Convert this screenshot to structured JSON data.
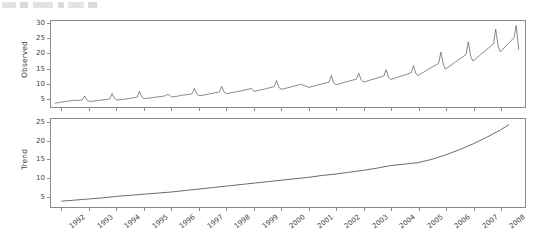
{
  "top_fragment": {
    "description": "cut-off-toolbar-strip"
  },
  "chart_data": [
    {
      "type": "line",
      "title": "",
      "panel": "Observed",
      "xlabel": "",
      "ylabel": "Observed",
      "ylim": [
        2,
        31
      ],
      "yticks": [
        5,
        10,
        15,
        20,
        25,
        30
      ],
      "xlim": [
        1991.6,
        2008.9
      ],
      "xticks": [
        1992,
        1993,
        1994,
        1995,
        1996,
        1997,
        1998,
        1999,
        2000,
        2001,
        2002,
        2003,
        2004,
        2005,
        2006,
        2007,
        2008
      ],
      "grid": false,
      "legend": null,
      "x": [
        1991.75,
        1991.83,
        1991.92,
        1992.0,
        1992.08,
        1992.17,
        1992.25,
        1992.33,
        1992.42,
        1992.5,
        1992.58,
        1992.67,
        1992.75,
        1992.83,
        1992.92,
        1993.0,
        1993.08,
        1993.17,
        1993.25,
        1993.33,
        1993.42,
        1993.5,
        1993.58,
        1993.67,
        1993.75,
        1993.83,
        1993.92,
        1994.0,
        1994.08,
        1994.17,
        1994.25,
        1994.33,
        1994.42,
        1994.5,
        1994.58,
        1994.67,
        1994.75,
        1994.83,
        1994.92,
        1995.0,
        1995.08,
        1995.17,
        1995.25,
        1995.33,
        1995.42,
        1995.5,
        1995.58,
        1995.67,
        1995.75,
        1995.83,
        1995.92,
        1996.0,
        1996.08,
        1996.17,
        1996.25,
        1996.33,
        1996.42,
        1996.5,
        1996.58,
        1996.67,
        1996.75,
        1996.83,
        1996.92,
        1997.0,
        1997.08,
        1997.17,
        1997.25,
        1997.33,
        1997.42,
        1997.5,
        1997.58,
        1997.67,
        1997.75,
        1997.83,
        1997.92,
        1998.0,
        1998.08,
        1998.17,
        1998.25,
        1998.33,
        1998.42,
        1998.5,
        1998.58,
        1998.67,
        1998.75,
        1998.83,
        1998.92,
        1999.0,
        1999.08,
        1999.17,
        1999.25,
        1999.33,
        1999.42,
        1999.5,
        1999.58,
        1999.67,
        1999.75,
        1999.83,
        1999.92,
        2000.0,
        2000.08,
        2000.17,
        2000.25,
        2000.33,
        2000.42,
        2000.5,
        2000.58,
        2000.67,
        2000.75,
        2000.83,
        2000.92,
        2001.0,
        2001.08,
        2001.17,
        2001.25,
        2001.33,
        2001.42,
        2001.5,
        2001.58,
        2001.67,
        2001.75,
        2001.83,
        2001.92,
        2002.0,
        2002.08,
        2002.17,
        2002.25,
        2002.33,
        2002.42,
        2002.5,
        2002.58,
        2002.67,
        2002.75,
        2002.83,
        2002.92,
        2003.0,
        2003.08,
        2003.17,
        2003.25,
        2003.33,
        2003.42,
        2003.5,
        2003.58,
        2003.67,
        2003.75,
        2003.83,
        2003.92,
        2004.0,
        2004.08,
        2004.17,
        2004.25,
        2004.33,
        2004.42,
        2004.5,
        2004.58,
        2004.67,
        2004.75,
        2004.83,
        2004.92,
        2005.0,
        2005.08,
        2005.17,
        2005.25,
        2005.33,
        2005.42,
        2005.5,
        2005.58,
        2005.67,
        2005.75,
        2005.83,
        2005.92,
        2006.0,
        2006.08,
        2006.17,
        2006.25,
        2006.33,
        2006.42,
        2006.5,
        2006.58,
        2006.67,
        2006.75,
        2006.83,
        2006.92,
        2007.0,
        2007.08,
        2007.17,
        2007.25,
        2007.33,
        2007.42,
        2007.5,
        2007.58,
        2007.67,
        2007.75,
        2007.83,
        2007.92,
        2008.0,
        2008.08,
        2008.17,
        2008.25,
        2008.33,
        2008.42,
        2008.5,
        2008.58,
        2008.67
      ],
      "values": [
        3.3,
        3.4,
        3.6,
        3.7,
        3.8,
        3.9,
        4.0,
        4.1,
        4.2,
        4.3,
        4.2,
        4.3,
        4.5,
        5.7,
        4.3,
        3.9,
        3.9,
        4.0,
        4.1,
        4.2,
        4.3,
        4.4,
        4.5,
        4.6,
        4.8,
        6.5,
        4.9,
        4.4,
        4.4,
        4.5,
        4.6,
        4.7,
        4.8,
        4.9,
        5.1,
        5.2,
        5.4,
        7.3,
        5.3,
        4.8,
        4.9,
        5.0,
        5.1,
        5.2,
        5.3,
        5.4,
        5.5,
        5.6,
        5.7,
        6.2,
        6.0,
        5.4,
        5.5,
        5.6,
        5.7,
        5.9,
        6.0,
        6.1,
        6.2,
        6.3,
        6.5,
        8.3,
        6.4,
        5.8,
        5.9,
        6.0,
        6.2,
        6.3,
        6.5,
        6.6,
        6.8,
        6.9,
        7.1,
        9.0,
        7.0,
        6.5,
        6.6,
        6.8,
        6.9,
        7.1,
        7.2,
        7.4,
        7.5,
        7.7,
        7.9,
        8.1,
        8.2,
        7.3,
        7.4,
        7.6,
        7.8,
        7.9,
        8.1,
        8.3,
        8.5,
        8.7,
        8.9,
        10.9,
        8.6,
        8.0,
        8.1,
        8.3,
        8.5,
        8.7,
        8.9,
        9.1,
        9.3,
        9.5,
        9.7,
        9.2,
        9.0,
        8.6,
        8.8,
        9.0,
        9.2,
        9.4,
        9.6,
        9.8,
        10.0,
        10.2,
        10.4,
        12.6,
        10.1,
        9.5,
        9.7,
        9.9,
        10.1,
        10.4,
        10.6,
        10.8,
        11.0,
        11.2,
        11.4,
        13.4,
        11.2,
        10.4,
        10.6,
        10.8,
        11.1,
        11.3,
        11.5,
        11.8,
        12.0,
        12.2,
        12.5,
        14.6,
        12.1,
        11.3,
        11.5,
        11.8,
        12.0,
        12.3,
        12.5,
        12.8,
        13.0,
        13.3,
        13.6,
        16.0,
        13.2,
        12.6,
        13.2,
        13.6,
        14.0,
        14.5,
        15.0,
        15.4,
        15.9,
        16.3,
        16.8,
        20.5,
        16.2,
        14.8,
        15.3,
        15.9,
        16.4,
        17.0,
        17.5,
        18.1,
        18.6,
        19.2,
        19.8,
        24.0,
        19.0,
        17.5,
        18.1,
        18.8,
        19.4,
        20.1,
        20.7,
        21.4,
        22.0,
        22.7,
        23.3,
        28.2,
        22.5,
        20.6,
        21.4,
        22.2,
        23.0,
        23.8,
        24.6,
        25.4,
        29.5,
        21.4
      ]
    },
    {
      "type": "line",
      "title": "",
      "panel": "Trend",
      "xlabel": "",
      "ylabel": "Trend",
      "ylim": [
        2,
        26
      ],
      "yticks": [
        5,
        10,
        15,
        20,
        25
      ],
      "xlim": [
        1991.6,
        2008.9
      ],
      "xticks": [
        1992,
        1993,
        1994,
        1995,
        1996,
        1997,
        1998,
        1999,
        2000,
        2001,
        2002,
        2003,
        2004,
        2005,
        2006,
        2007,
        2008
      ],
      "grid": false,
      "legend": null,
      "x": [
        1992.0,
        1992.5,
        1993.0,
        1993.5,
        1994.0,
        1994.5,
        1995.0,
        1995.5,
        1996.0,
        1996.5,
        1997.0,
        1997.5,
        1998.0,
        1998.5,
        1999.0,
        1999.5,
        2000.0,
        2000.5,
        2001.0,
        2001.5,
        2002.0,
        2002.5,
        2003.0,
        2003.5,
        2004.0,
        2004.5,
        2005.0,
        2005.5,
        2006.0,
        2006.5,
        2007.0,
        2007.5,
        2008.0,
        2008.3
      ],
      "values": [
        3.6,
        3.9,
        4.2,
        4.5,
        4.9,
        5.2,
        5.5,
        5.8,
        6.1,
        6.5,
        6.9,
        7.3,
        7.7,
        8.1,
        8.5,
        8.9,
        9.3,
        9.7,
        10.1,
        10.6,
        11.0,
        11.5,
        12.0,
        12.6,
        13.3,
        13.7,
        14.1,
        15.0,
        16.2,
        17.6,
        19.2,
        21.0,
        23.0,
        24.4
      ]
    }
  ]
}
